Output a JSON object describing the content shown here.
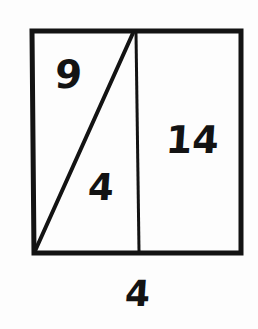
{
  "figure": {
    "background_color": "#fdfdfd",
    "ink_color": "#131313",
    "labels": {
      "upper_left_region": "9",
      "lower_middle_region": "4",
      "right_region": "14",
      "bottom_base": "4"
    },
    "shapes": {
      "outer_rectangle": {
        "name": "rectangle",
        "stroke_width": 5,
        "top_left": [
          32,
          31
        ],
        "top_right": [
          241,
          31
        ],
        "bottom_right": [
          241,
          253
        ],
        "bottom_left": [
          34,
          253
        ]
      },
      "diagonal_segment": {
        "name": "diagonal",
        "stroke_width": 4,
        "from": [
          133,
          33
        ],
        "to": [
          35,
          251
        ]
      },
      "vertical_segment": {
        "name": "vertical-divider",
        "stroke_width": 3,
        "from": [
          136,
          33
        ],
        "to": [
          139,
          251
        ]
      }
    }
  }
}
